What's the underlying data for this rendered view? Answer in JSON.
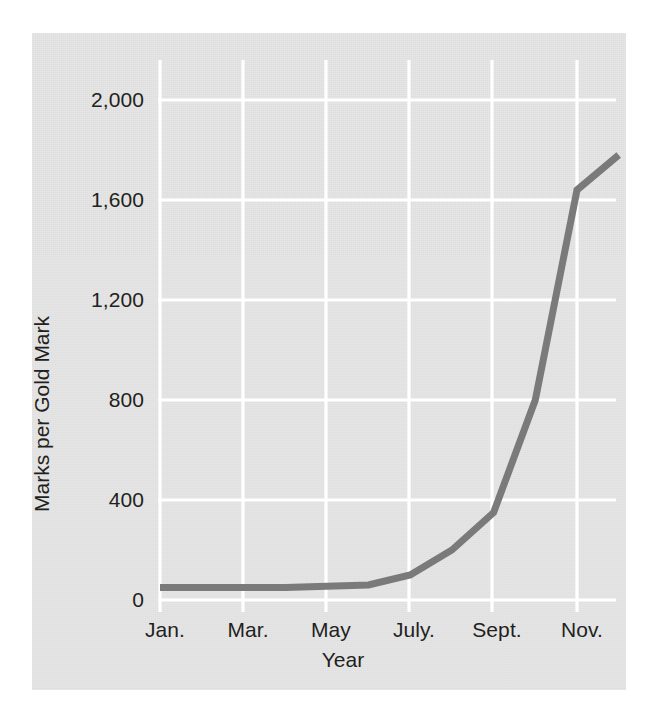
{
  "figure": {
    "background_color": "#ffffff",
    "panel_color": "#e3e3e3",
    "grid_color": "#ffffff",
    "line_color": "#7a7a7a",
    "text_color": "#231f20"
  },
  "chart_data": {
    "type": "line",
    "title": "",
    "xlabel": "Year",
    "ylabel": "Marks per Gold Mark",
    "categories": [
      "Jan.",
      "Feb.",
      "Mar.",
      "Apr.",
      "May",
      "June",
      "July.",
      "Aug.",
      "Sept.",
      "Oct.",
      "Nov.",
      "Dec."
    ],
    "x_tick_labels": [
      "Jan.",
      "Mar.",
      "May",
      "July.",
      "Sept.",
      "Nov."
    ],
    "y_tick_labels": [
      "0",
      "400",
      "800",
      "1,200",
      "1,600",
      "2,000"
    ],
    "y_ticks": [
      0,
      400,
      800,
      1200,
      1600,
      2000
    ],
    "ylim": [
      0,
      2080
    ],
    "grid": true,
    "legend": false,
    "series": [
      {
        "name": "Marks per Gold Mark",
        "values": [
          50,
          50,
          50,
          50,
          55,
          60,
          100,
          200,
          350,
          800,
          1640,
          1780
        ]
      }
    ]
  }
}
